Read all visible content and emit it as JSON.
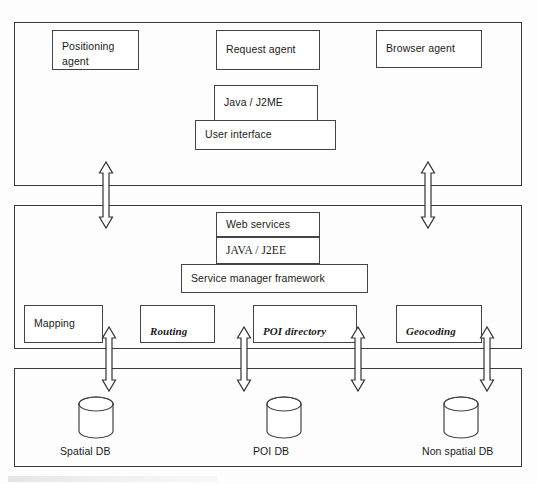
{
  "diagram": {
    "stroke_color": "#3a3a3a",
    "background_color": "#fdfdfd"
  },
  "layers": [
    {
      "name": "client-layer",
      "nodes": [
        {
          "id": "positioning-agent",
          "label": "Positioning\nagent"
        },
        {
          "id": "request-agent",
          "label": "Request agent"
        },
        {
          "id": "browser-agent",
          "label": "Browser agent"
        },
        {
          "id": "java-j2me",
          "label": "Java / J2ME"
        },
        {
          "id": "user-interface",
          "label": "User interface"
        }
      ]
    },
    {
      "name": "server-layer",
      "nodes": [
        {
          "id": "web-services",
          "label": "Web services"
        },
        {
          "id": "java-j2ee",
          "label": "JAVA / J2EE"
        },
        {
          "id": "service-manager-framework",
          "label": "Service manager framework"
        },
        {
          "id": "mapping",
          "label": "Mapping"
        },
        {
          "id": "routing",
          "label": "Routing"
        },
        {
          "id": "poi-directory",
          "label": "POI directory"
        },
        {
          "id": "geocoding",
          "label": "Geocoding"
        }
      ]
    },
    {
      "name": "data-layer",
      "nodes": [
        {
          "id": "spatial-db",
          "label": "Spatial DB"
        },
        {
          "id": "poi-db",
          "label": "POI DB"
        },
        {
          "id": "non-spatial-db",
          "label": "Non spatial DB"
        }
      ]
    }
  ],
  "connectors": [
    {
      "id": "client-server-left",
      "kind": "double-headed-arrow"
    },
    {
      "id": "client-server-right",
      "kind": "double-headed-arrow"
    },
    {
      "id": "server-data-1",
      "kind": "double-headed-arrow"
    },
    {
      "id": "server-data-2",
      "kind": "double-headed-arrow"
    },
    {
      "id": "server-data-3",
      "kind": "double-headed-arrow"
    },
    {
      "id": "server-data-4",
      "kind": "double-headed-arrow"
    }
  ]
}
